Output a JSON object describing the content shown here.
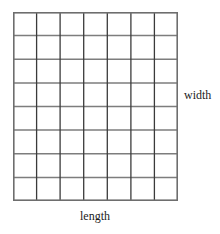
{
  "figure": {
    "type": "rectangle-area-grid",
    "labels": {
      "width": "width",
      "length": "length"
    },
    "grid": {
      "columns": 7,
      "rows": 8,
      "total_cells": 56,
      "line_color_horizontal": "#7d7d7d",
      "line_color_vertical": "#3b3b3b",
      "border_color": "#6e6e6e",
      "fill_color": "#ffffff",
      "background_color": "#ffffff",
      "x_left": 0,
      "x_right": 165,
      "y_top": 0,
      "y_bottom": 189
    }
  }
}
